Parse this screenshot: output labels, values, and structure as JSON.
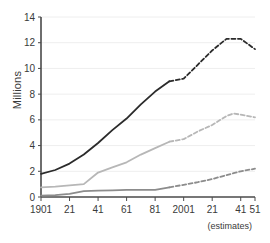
{
  "chart_data": {
    "type": "line",
    "title": "",
    "xlabel": "",
    "ylabel": "Millions",
    "xlim": [
      1901,
      2051
    ],
    "ylim": [
      0,
      14
    ],
    "grid": true,
    "legend": "none",
    "annotation": "(estimates)",
    "estimates_start_year": 1991,
    "ytick_labels": [
      "0",
      "2",
      "4",
      "6",
      "8",
      "10",
      "12",
      "14"
    ],
    "ytick_values": [
      0,
      2,
      4,
      6,
      8,
      10,
      12,
      14
    ],
    "xtick_labels": [
      "1901",
      "21",
      "41",
      "61",
      "81",
      "2001",
      "21",
      "41",
      "51"
    ],
    "xtick_values": [
      1901,
      1921,
      1941,
      1961,
      1981,
      2001,
      2021,
      2041,
      2051
    ],
    "x": [
      1901,
      1911,
      1921,
      1931,
      1941,
      1951,
      1961,
      1971,
      1981,
      1991,
      2001,
      2011,
      2021,
      2031,
      2036,
      2041,
      2051
    ],
    "series": [
      {
        "name": "total",
        "color": "#2b2b2b",
        "values": [
          1.8,
          2.1,
          2.6,
          3.3,
          4.2,
          5.2,
          6.1,
          7.2,
          8.2,
          9.0,
          9.2,
          10.3,
          11.4,
          12.3,
          12.3,
          12.3,
          11.5
        ]
      },
      {
        "name": "middle",
        "color": "#b7b7b7",
        "values": [
          0.75,
          0.8,
          0.9,
          1.0,
          1.9,
          2.3,
          2.7,
          3.3,
          3.8,
          4.3,
          4.5,
          5.1,
          5.6,
          6.3,
          6.5,
          6.4,
          6.2
        ]
      },
      {
        "name": "lower",
        "color": "#8c8c8c",
        "values": [
          0.1,
          0.15,
          0.25,
          0.45,
          0.5,
          0.52,
          0.55,
          0.56,
          0.55,
          0.75,
          0.95,
          1.15,
          1.4,
          1.7,
          1.85,
          2.0,
          2.2
        ]
      }
    ]
  }
}
